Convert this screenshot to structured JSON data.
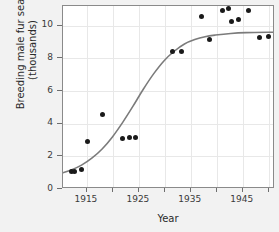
{
  "chart_data": {
    "type": "scatter",
    "title": "",
    "xlabel": "Year",
    "ylabel": "Breeding male fur seals (thousands)",
    "ylabel_line1": "Breeding male fur seals",
    "ylabel_line2": "(thousands)",
    "xlim": [
      1910.4,
      1951.2
    ],
    "ylim": [
      0,
      11.2
    ],
    "grid": true,
    "legend": "none",
    "x_ticks_labeled": [
      "1915",
      "1925",
      "1935",
      "1945"
    ],
    "x_ticks_all": [
      1915,
      1920,
      1925,
      1930,
      1935,
      1940,
      1945,
      1950
    ],
    "y_ticks": [
      "0",
      "2",
      "4",
      "6",
      "8",
      "10"
    ],
    "y_tick_values": [
      0,
      2,
      4,
      6,
      8,
      10
    ],
    "point_color": "#1a1a1a",
    "curve_color": "#7b7b7b",
    "background_color": "#f2f2f2",
    "plot_background_color": "#ffffff",
    "points": [
      {
        "x": 1912.0,
        "y": 1.1
      },
      {
        "x": 1912.6,
        "y": 1.1
      },
      {
        "x": 1914.0,
        "y": 1.2
      },
      {
        "x": 1915.2,
        "y": 2.9
      },
      {
        "x": 1918.0,
        "y": 4.55
      },
      {
        "x": 1921.8,
        "y": 3.1
      },
      {
        "x": 1923.2,
        "y": 3.15
      },
      {
        "x": 1924.3,
        "y": 3.15
      },
      {
        "x": 1931.5,
        "y": 8.4
      },
      {
        "x": 1933.2,
        "y": 8.4
      },
      {
        "x": 1937.0,
        "y": 10.55
      },
      {
        "x": 1938.6,
        "y": 9.15
      },
      {
        "x": 1941.0,
        "y": 10.9
      },
      {
        "x": 1942.3,
        "y": 11.05
      },
      {
        "x": 1942.8,
        "y": 10.25
      },
      {
        "x": 1944.2,
        "y": 10.4
      },
      {
        "x": 1946.0,
        "y": 10.9
      },
      {
        "x": 1948.3,
        "y": 9.3
      },
      {
        "x": 1950.0,
        "y": 9.35
      }
    ],
    "fitted_curve": {
      "name": "logistic fit",
      "points": [
        {
          "x": 1910.4,
          "y": 0.88
        },
        {
          "x": 1912.0,
          "y": 1.05
        },
        {
          "x": 1914.0,
          "y": 1.35
        },
        {
          "x": 1916.0,
          "y": 1.78
        },
        {
          "x": 1918.0,
          "y": 2.35
        },
        {
          "x": 1920.0,
          "y": 3.1
        },
        {
          "x": 1922.0,
          "y": 4.0
        },
        {
          "x": 1924.0,
          "y": 5.0
        },
        {
          "x": 1926.0,
          "y": 6.05
        },
        {
          "x": 1928.0,
          "y": 7.0
        },
        {
          "x": 1930.0,
          "y": 7.8
        },
        {
          "x": 1932.0,
          "y": 8.4
        },
        {
          "x": 1934.0,
          "y": 8.85
        },
        {
          "x": 1936.0,
          "y": 9.12
        },
        {
          "x": 1938.0,
          "y": 9.3
        },
        {
          "x": 1940.0,
          "y": 9.4
        },
        {
          "x": 1943.0,
          "y": 9.5
        },
        {
          "x": 1946.0,
          "y": 9.55
        },
        {
          "x": 1951.2,
          "y": 9.58
        }
      ]
    }
  }
}
